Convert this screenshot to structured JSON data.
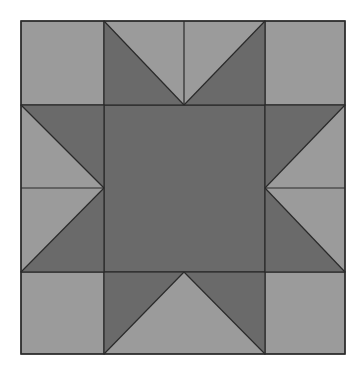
{
  "diagram": {
    "type": "quilt-block",
    "pattern": "sawtooth-star",
    "grid": {
      "x": [
        21,
        104,
        184,
        265,
        345
      ],
      "y": [
        21,
        105,
        188,
        272,
        354
      ]
    },
    "colors": {
      "background": "#ffffff",
      "light": "#9b9b9b",
      "dark": "#6a6a6a",
      "line": "#2a2a2a"
    },
    "corner_squares": [
      "top-left",
      "top-right",
      "bottom-left",
      "bottom-right"
    ],
    "center_square": "dark",
    "star_points": [
      "top",
      "right",
      "bottom",
      "left"
    ],
    "seam_lines": {
      "top_center_vertical": true,
      "bottom_center_vertical": false,
      "left_center_horizontal": true,
      "right_center_horizontal": true
    }
  }
}
